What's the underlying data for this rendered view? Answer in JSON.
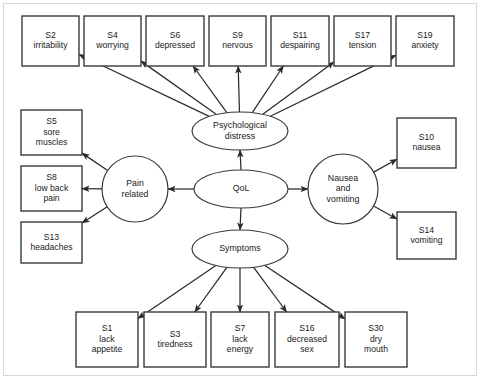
{
  "diagram": {
    "type": "path-diagram",
    "stroke_color": "#2b2b2b",
    "box_fill": "#ffffff",
    "frame_color": "#d8d8d8",
    "latent_variables": [
      {
        "id": "psychological-distress",
        "label_lines": [
          "Psychological",
          "distress"
        ],
        "shape": "ellipse",
        "cx": 240,
        "cy": 131,
        "rx": 48,
        "ry": 19
      },
      {
        "id": "qol",
        "label_lines": [
          "QoL"
        ],
        "shape": "ellipse",
        "cx": 241,
        "cy": 189,
        "rx": 47,
        "ry": 19
      },
      {
        "id": "symptoms",
        "label_lines": [
          "Symptoms"
        ],
        "shape": "ellipse",
        "cx": 240,
        "cy": 249,
        "rx": 48,
        "ry": 19
      },
      {
        "id": "pain-related",
        "label_lines": [
          "Pain",
          "related"
        ],
        "shape": "circle",
        "cx": 135,
        "cy": 189,
        "rx": 33,
        "ry": 33
      },
      {
        "id": "nausea-and-vomiting",
        "label_lines": [
          "Nausea",
          "and",
          "vomiting"
        ],
        "shape": "circle",
        "cx": 343,
        "cy": 189,
        "rx": 35,
        "ry": 35
      }
    ],
    "indicators": {
      "top_row": [
        {
          "id": "s2",
          "code": "S2",
          "name": "irritability",
          "x": 22,
          "y": 16,
          "w": 57,
          "h": 50
        },
        {
          "id": "s4",
          "code": "S4",
          "name": "worrying",
          "x": 84,
          "y": 16,
          "w": 57,
          "h": 50
        },
        {
          "id": "s6",
          "code": "S6",
          "name": "depressed",
          "x": 146,
          "y": 16,
          "w": 58,
          "h": 50
        },
        {
          "id": "s9",
          "code": "S9",
          "name": "nervous",
          "x": 209,
          "y": 16,
          "w": 57,
          "h": 50
        },
        {
          "id": "s11",
          "code": "S11",
          "name": "despairing",
          "x": 271,
          "y": 16,
          "w": 58,
          "h": 50
        },
        {
          "id": "s17",
          "code": "S17",
          "name": "tension",
          "x": 334,
          "y": 16,
          "w": 57,
          "h": 50
        },
        {
          "id": "s19",
          "code": "S19",
          "name": "anxiety",
          "x": 396,
          "y": 16,
          "w": 58,
          "h": 50
        }
      ],
      "left_column": [
        {
          "id": "s5",
          "code": "S5",
          "name_lines": [
            "sore",
            "muscles"
          ],
          "x": 21,
          "y": 110,
          "w": 61,
          "h": 45
        },
        {
          "id": "s8",
          "code": "S8",
          "name_lines": [
            "low back",
            "pain"
          ],
          "x": 21,
          "y": 166,
          "w": 61,
          "h": 45
        },
        {
          "id": "s13",
          "code": "S13",
          "name_lines": [
            "headaches"
          ],
          "x": 21,
          "y": 222,
          "w": 61,
          "h": 41
        }
      ],
      "right_column": [
        {
          "id": "s10",
          "code": "S10",
          "name_lines": [
            "nausea"
          ],
          "x": 397,
          "y": 118,
          "w": 59,
          "h": 50
        },
        {
          "id": "s14",
          "code": "S14",
          "name_lines": [
            "vomiting"
          ],
          "x": 397,
          "y": 212,
          "w": 59,
          "h": 47
        }
      ],
      "bottom_row": [
        {
          "id": "s1",
          "code": "S1",
          "name_lines": [
            "lack",
            "appetite"
          ],
          "x": 76,
          "y": 312,
          "w": 62,
          "h": 55
        },
        {
          "id": "s3",
          "code": "S3",
          "name_lines": [
            "tiredness"
          ],
          "x": 144,
          "y": 312,
          "w": 62,
          "h": 55
        },
        {
          "id": "s7",
          "code": "S7",
          "name_lines": [
            "lack",
            "energy"
          ],
          "x": 211,
          "y": 312,
          "w": 58,
          "h": 55
        },
        {
          "id": "s16",
          "code": "S16",
          "name_lines": [
            "decreased",
            "sex"
          ],
          "x": 275,
          "y": 312,
          "w": 64,
          "h": 55
        },
        {
          "id": "s30",
          "code": "S30",
          "name_lines": [
            "dry",
            "mouth"
          ],
          "x": 345,
          "y": 312,
          "w": 62,
          "h": 55
        }
      ]
    },
    "edges": [
      {
        "from": "qol",
        "to": "psychological-distress",
        "kind": "vertical-up"
      },
      {
        "from": "qol",
        "to": "symptoms",
        "kind": "vertical-down"
      },
      {
        "from": "qol",
        "to": "pain-related",
        "kind": "horizontal-left"
      },
      {
        "from": "qol",
        "to": "nausea-and-vomiting",
        "kind": "horizontal-right"
      },
      {
        "from": "psychological-distress",
        "to": "s2",
        "kind": "fan-up"
      },
      {
        "from": "psychological-distress",
        "to": "s4",
        "kind": "fan-up"
      },
      {
        "from": "psychological-distress",
        "to": "s6",
        "kind": "fan-up"
      },
      {
        "from": "psychological-distress",
        "to": "s9",
        "kind": "fan-up"
      },
      {
        "from": "psychological-distress",
        "to": "s11",
        "kind": "fan-up"
      },
      {
        "from": "psychological-distress",
        "to": "s17",
        "kind": "fan-up"
      },
      {
        "from": "psychological-distress",
        "to": "s19",
        "kind": "fan-up"
      },
      {
        "from": "pain-related",
        "to": "s5",
        "kind": "fan-left"
      },
      {
        "from": "pain-related",
        "to": "s8",
        "kind": "fan-left"
      },
      {
        "from": "pain-related",
        "to": "s13",
        "kind": "fan-left"
      },
      {
        "from": "nausea-and-vomiting",
        "to": "s10",
        "kind": "fan-right"
      },
      {
        "from": "nausea-and-vomiting",
        "to": "s14",
        "kind": "fan-right"
      },
      {
        "from": "symptoms",
        "to": "s1",
        "kind": "fan-down"
      },
      {
        "from": "symptoms",
        "to": "s3",
        "kind": "fan-down"
      },
      {
        "from": "symptoms",
        "to": "s7",
        "kind": "fan-down"
      },
      {
        "from": "symptoms",
        "to": "s16",
        "kind": "fan-down"
      },
      {
        "from": "symptoms",
        "to": "s30",
        "kind": "fan-down"
      }
    ]
  }
}
